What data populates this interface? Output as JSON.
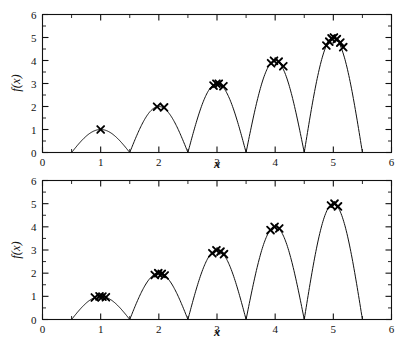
{
  "figure": {
    "title": "",
    "panel_count": 2,
    "background": "#ffffff",
    "line_color": "#111111",
    "marker_color": "#000000",
    "marker_symbol": "x"
  },
  "axes": {
    "xlabel": "x",
    "ylabel": "f(x)",
    "xlim": [
      0,
      6
    ],
    "ylim": [
      0,
      6
    ],
    "xticks": [
      0,
      1,
      2,
      3,
      4,
      5,
      6
    ],
    "yticks": [
      0,
      1,
      2,
      3,
      4,
      5,
      6
    ],
    "xticklabels": [
      "0",
      "1",
      "2",
      "3",
      "4",
      "5",
      "6"
    ],
    "yticklabels": [
      "0",
      "1",
      "2",
      "3",
      "4",
      "5",
      "6"
    ],
    "xminor_step": 0.5,
    "yminor_step": 0.5,
    "grid": false,
    "legend": false
  },
  "chart_data": [
    {
      "type": "line",
      "name": "panel-top",
      "title": "",
      "xlabel": "x",
      "ylabel": "f(x)",
      "xlim": [
        0,
        6
      ],
      "ylim": [
        0,
        6
      ],
      "xticks": [
        0,
        1,
        2,
        3,
        4,
        5,
        6
      ],
      "yticks": [
        0,
        1,
        2,
        3,
        4,
        5,
        6
      ],
      "grid": false,
      "legend": false,
      "curve_description": "Five arches; arch n spans x from n-0.5 to n+0.5 with peak height n at x=n",
      "curve_peaks": [
        {
          "x": 1,
          "y": 1
        },
        {
          "x": 2,
          "y": 2
        },
        {
          "x": 3,
          "y": 3
        },
        {
          "x": 4,
          "y": 4
        },
        {
          "x": 5,
          "y": 5
        }
      ],
      "curve_zeros": [
        0.5,
        1.5,
        2.5,
        3.5,
        4.5,
        5.5
      ],
      "series": [
        {
          "name": "sampled points",
          "marker": "x",
          "points": [
            {
              "x": 1.0,
              "y": 1.0
            },
            {
              "x": 1.97,
              "y": 1.99
            },
            {
              "x": 2.09,
              "y": 1.96
            },
            {
              "x": 2.94,
              "y": 2.91
            },
            {
              "x": 2.99,
              "y": 2.99
            },
            {
              "x": 3.03,
              "y": 2.99
            },
            {
              "x": 3.11,
              "y": 2.88
            },
            {
              "x": 3.93,
              "y": 3.88
            },
            {
              "x": 3.98,
              "y": 3.99
            },
            {
              "x": 4.06,
              "y": 3.95
            },
            {
              "x": 4.14,
              "y": 3.75
            },
            {
              "x": 4.88,
              "y": 4.65
            },
            {
              "x": 4.93,
              "y": 4.82
            },
            {
              "x": 4.97,
              "y": 4.96
            },
            {
              "x": 5.01,
              "y": 5.0
            },
            {
              "x": 5.06,
              "y": 4.93
            },
            {
              "x": 5.12,
              "y": 4.78
            },
            {
              "x": 5.17,
              "y": 4.58
            }
          ]
        }
      ]
    },
    {
      "type": "line",
      "name": "panel-bottom",
      "title": "",
      "xlabel": "x",
      "ylabel": "f(x)",
      "xlim": [
        0,
        6
      ],
      "ylim": [
        0,
        6
      ],
      "xticks": [
        0,
        1,
        2,
        3,
        4,
        5,
        6
      ],
      "yticks": [
        0,
        1,
        2,
        3,
        4,
        5,
        6
      ],
      "grid": false,
      "legend": false,
      "curve_description": "Five arches; arch n spans x from n-0.5 to n+0.5 with peak height n at x=n",
      "curve_peaks": [
        {
          "x": 1,
          "y": 1
        },
        {
          "x": 2,
          "y": 2
        },
        {
          "x": 3,
          "y": 3
        },
        {
          "x": 4,
          "y": 4
        },
        {
          "x": 5,
          "y": 5
        }
      ],
      "curve_zeros": [
        0.5,
        1.5,
        2.5,
        3.5,
        4.5,
        5.5
      ],
      "series": [
        {
          "name": "sampled points",
          "marker": "x",
          "points": [
            {
              "x": 0.9,
              "y": 0.95
            },
            {
              "x": 0.98,
              "y": 1.0
            },
            {
              "x": 1.03,
              "y": 0.99
            },
            {
              "x": 1.09,
              "y": 0.96
            },
            {
              "x": 1.93,
              "y": 1.92
            },
            {
              "x": 1.99,
              "y": 2.0
            },
            {
              "x": 2.05,
              "y": 1.97
            },
            {
              "x": 2.1,
              "y": 1.9
            },
            {
              "x": 2.92,
              "y": 2.86
            },
            {
              "x": 2.99,
              "y": 2.99
            },
            {
              "x": 3.06,
              "y": 2.93
            },
            {
              "x": 3.12,
              "y": 2.82
            },
            {
              "x": 3.92,
              "y": 3.86
            },
            {
              "x": 3.99,
              "y": 4.0
            },
            {
              "x": 4.07,
              "y": 3.93
            },
            {
              "x": 4.96,
              "y": 4.92
            },
            {
              "x": 5.02,
              "y": 5.0
            },
            {
              "x": 5.08,
              "y": 4.88
            }
          ]
        }
      ]
    }
  ]
}
